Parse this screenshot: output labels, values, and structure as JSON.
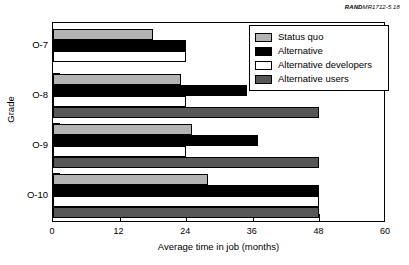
{
  "source_credit": {
    "prefix": "RAND",
    "id": "MR1712-5.18"
  },
  "chart_data": {
    "type": "bar",
    "orientation": "horizontal",
    "title": "",
    "subtitle": "",
    "xlabel": "Average time in job (months)",
    "ylabel": "Grade",
    "categories": [
      "O-7",
      "O-8",
      "O-9",
      "O-10"
    ],
    "xlim": [
      0,
      60
    ],
    "xticks": [
      0,
      12,
      24,
      36,
      48,
      60
    ],
    "xtick_labels": [
      "0",
      "12",
      "24",
      "36",
      "48",
      "60"
    ],
    "grid": false,
    "legend_position": "top-right",
    "series": [
      {
        "name": "Status quo",
        "color": "#b3b3b3",
        "values": [
          18,
          23,
          25,
          28
        ]
      },
      {
        "name": "Alternative",
        "color": "#000000",
        "values": [
          24,
          35,
          37,
          48
        ]
      },
      {
        "name": "Alternative developers",
        "color": "#ffffff",
        "values": [
          24,
          24,
          24,
          48
        ]
      },
      {
        "name": "Alternative users",
        "color": "#575757",
        "values": [
          null,
          48,
          48,
          48
        ]
      }
    ]
  }
}
